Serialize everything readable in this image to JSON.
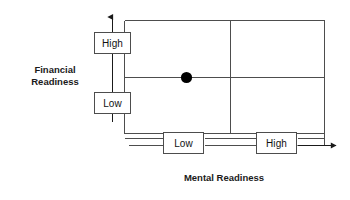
{
  "diagram": {
    "title_y_axis": "Financial\nReadiness",
    "title_x_axis": "Mental Readiness",
    "axes": {
      "y": {
        "label": "Financial Readiness",
        "ticks": [
          {
            "id": "fin-high",
            "label": "High"
          },
          {
            "id": "fin-low",
            "label": "Low"
          }
        ]
      },
      "x": {
        "label": "Mental Readiness",
        "ticks": [
          {
            "id": "men-low",
            "label": "Low"
          },
          {
            "id": "men-high",
            "label": "High"
          }
        ]
      }
    },
    "marker": {
      "name": "data-point",
      "x_quadrant": "Low",
      "y_quadrant": "between High and Low",
      "color": "#000000"
    },
    "colors": {
      "line": "#4d4d4d",
      "box_border": "#4d4d4d",
      "box_fill": "#ffffff",
      "text": "#111111",
      "background": "#ffffff",
      "marker": "#000000"
    }
  }
}
